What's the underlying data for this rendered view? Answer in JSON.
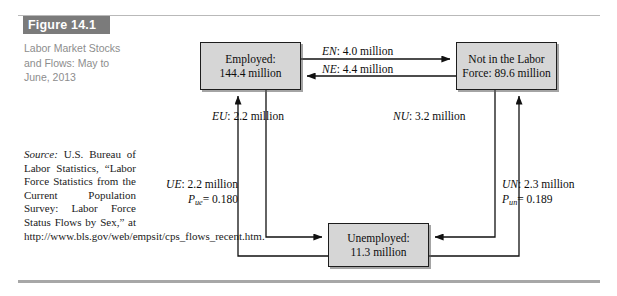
{
  "figure": {
    "tag": "Figure 14.1",
    "caption": "Labor Market Stocks and Flows: May to June, 2013",
    "source_label": "Source:",
    "source_text": " U.S. Bureau of Labor Statistics, “Labor Force Statistics from the Current Population Survey: Labor Force Status Flows by Sex,” at http://www.bls.gov/web/empsit/cps_flows_recent.htm."
  },
  "diagram": {
    "type": "flow-diagram",
    "nodes": [
      {
        "id": "employed",
        "line1": "Employed:",
        "line2": "144.4 million"
      },
      {
        "id": "nilf",
        "line1": "Not in the Labor",
        "line2": "Force: 89.6 million"
      },
      {
        "id": "unemployed",
        "line1": "Unemployed:",
        "line2": "11.3 million"
      }
    ],
    "flows": [
      {
        "id": "en",
        "code": "EN",
        "value": "4.0 million",
        "label": "EN: 4.0 million",
        "from": "employed",
        "to": "nilf"
      },
      {
        "id": "ne",
        "code": "NE",
        "value": "4.4 million",
        "label": "NE: 4.4 million",
        "from": "nilf",
        "to": "employed"
      },
      {
        "id": "eu",
        "code": "EU",
        "value": "2.2 million",
        "label": "EU: 2.2 million",
        "from": "employed",
        "to": "unemployed"
      },
      {
        "id": "nu",
        "code": "NU",
        "value": "3.2 million",
        "label": "NU: 3.2 million",
        "from": "nilf",
        "to": "unemployed"
      },
      {
        "id": "ue",
        "code": "UE",
        "value": "2.2 million",
        "label": "UE: 2.2 million",
        "prob_var": "P",
        "prob_sub": "ue",
        "prob_value": "= 0.180",
        "from": "unemployed",
        "to": "employed"
      },
      {
        "id": "un",
        "code": "UN",
        "value": "2.3 million",
        "label": "UN: 2.3 million",
        "prob_var": "P",
        "prob_sub": "un",
        "prob_value": "= 0.189",
        "from": "unemployed",
        "to": "nilf"
      }
    ]
  },
  "colors": {
    "box_fill": "#d6d6d6",
    "box_border": "#1d1d1d",
    "tag_bg": "#7b7b7b",
    "caption_text": "#8d8d8d",
    "rule": "#b9b9b9"
  }
}
